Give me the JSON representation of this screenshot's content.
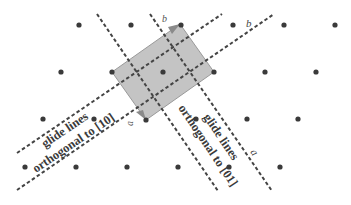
{
  "diagram": {
    "colors": {
      "dot": "#3a3a3a",
      "line": "#444444",
      "cell_fill": "#c4c4c4",
      "cell_stroke": "#9a9a9a",
      "arrow": "#8a8a8a"
    },
    "lattice_points": [
      [
        79,
        25
      ],
      [
        131,
        25
      ],
      [
        181,
        25
      ],
      [
        233,
        25
      ],
      [
        284,
        25
      ],
      [
        335,
        25
      ],
      [
        61,
        72
      ],
      [
        112,
        72
      ],
      [
        163,
        72
      ],
      [
        214,
        72
      ],
      [
        265,
        72
      ],
      [
        316,
        72
      ],
      [
        43,
        119
      ],
      [
        94,
        119
      ],
      [
        146,
        120
      ],
      [
        196,
        119
      ],
      [
        247,
        119
      ],
      [
        298,
        119
      ],
      [
        25,
        167
      ],
      [
        76,
        167
      ],
      [
        127,
        167
      ],
      [
        178,
        167
      ],
      [
        229,
        167
      ],
      [
        280,
        167
      ]
    ],
    "unit_cell": [
      [
        112,
        72
      ],
      [
        180,
        24
      ],
      [
        214,
        72
      ],
      [
        146,
        120
      ]
    ],
    "vectors": {
      "a": {
        "label": "a",
        "arrow": "⃗",
        "from": [
          112,
          72
        ],
        "to": [
          146,
          120
        ]
      },
      "b": {
        "label": "b",
        "arrow": "⃗",
        "from": [
          112,
          72
        ],
        "to": [
          180,
          24
        ]
      }
    },
    "lines": {
      "orthogonal_10": [
        {
          "from": [
            17,
            153
          ],
          "to": [
            222,
            14
          ]
        },
        {
          "from": [
            17,
            190
          ],
          "to": [
            274,
            14
          ]
        }
      ],
      "orthogonal_01": [
        {
          "from": [
            97,
            14
          ],
          "to": [
            218,
            191
          ]
        },
        {
          "from": [
            150,
            14
          ],
          "to": [
            272,
            191
          ]
        }
      ]
    },
    "labels": {
      "glide_10_line1": "glide lines",
      "glide_10_line2": "orthogonal to [10]",
      "glide_01_line1": "glide lines",
      "glide_01_line2": "orthogonal to [01]",
      "axis_a": "a",
      "axis_b": "b",
      "vector_a": "a⃗",
      "vector_b": "b⃗"
    }
  }
}
